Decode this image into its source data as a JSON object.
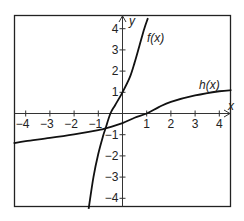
{
  "chart_data": {
    "type": "line",
    "title": "",
    "xlabel": "x",
    "ylabel": "y",
    "xlim": [
      -4.5,
      4.5
    ],
    "ylim": [
      -4.5,
      4.5
    ],
    "grid": false,
    "x_ticks": [
      -4,
      -3,
      -2,
      -1,
      1,
      2,
      3,
      4
    ],
    "y_ticks": [
      -4,
      -3,
      -2,
      -1,
      1,
      2,
      3,
      4
    ],
    "x_tick_labels": [
      "−4",
      "−3",
      "−2",
      "−1",
      "1",
      "2",
      "3",
      "4"
    ],
    "y_tick_labels": [
      "−4",
      "−3",
      "−2",
      "−1",
      "1",
      "2",
      "3",
      "4"
    ],
    "series": [
      {
        "name": "f(x)",
        "label": "f(x)",
        "x": [
          -1.4,
          -1.2,
          -1.0,
          -0.8,
          -0.7,
          -0.5,
          -0.3,
          0.0,
          0.3,
          0.5,
          0.7,
          0.9,
          1.05
        ],
        "y": [
          -4.5,
          -3.0,
          -1.9,
          -1.05,
          -0.7,
          0.0,
          0.4,
          1.0,
          1.7,
          2.4,
          3.2,
          4.0,
          4.5
        ]
      },
      {
        "name": "h(x)",
        "label": "h(x)",
        "x": [
          -4.5,
          -4.0,
          -3.0,
          -2.0,
          -1.0,
          -0.7,
          0.0,
          0.5,
          1.0,
          1.5,
          2.0,
          3.0,
          4.0,
          4.5
        ],
        "y": [
          -1.4,
          -1.3,
          -1.15,
          -0.98,
          -0.78,
          -0.7,
          -0.45,
          -0.2,
          0.0,
          0.3,
          0.55,
          0.85,
          1.05,
          1.1
        ]
      }
    ],
    "annotations": [
      {
        "text": "f(x)",
        "x": 1.0,
        "y": 3.6
      },
      {
        "text": "h(x)",
        "x": 3.3,
        "y": 1.3
      }
    ],
    "legend": "none"
  },
  "labels": {
    "x_axis": "x",
    "y_axis": "y",
    "f_label": "f(x)",
    "h_label": "h(x)",
    "xticks": [
      "−4",
      "−3",
      "−2",
      "−1",
      "1",
      "2",
      "3",
      "4"
    ],
    "yticks": [
      "4",
      "3",
      "2",
      "1",
      "−1",
      "−2",
      "−3",
      "−4"
    ]
  }
}
